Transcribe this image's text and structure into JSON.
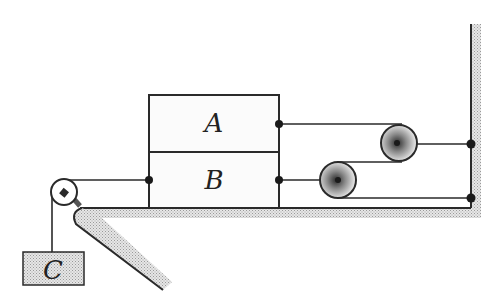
{
  "diagram": {
    "type": "physics-pulley-system",
    "blocks": [
      {
        "id": "A",
        "label": "A"
      },
      {
        "id": "B",
        "label": "B"
      },
      {
        "id": "C",
        "label": "C"
      }
    ],
    "pulleys": [
      {
        "id": "left-pulley",
        "description": "fixed pulley at table edge"
      },
      {
        "id": "upper-right-pulley",
        "description": "movable pulley connected to A"
      },
      {
        "id": "lower-right-pulley",
        "description": "movable pulley connected to B"
      }
    ],
    "colors": {
      "line": "#2a2a2a",
      "hatch": "#b8b8b8",
      "background": "#ffffff"
    }
  }
}
